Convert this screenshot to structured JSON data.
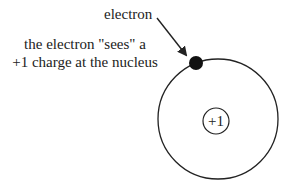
{
  "diagram": {
    "labels": {
      "electron": "electron",
      "sees_line1": "the electron \"sees\" a",
      "sees_line2": "+1 charge at the nucleus"
    },
    "nucleus": {
      "charge": "+1"
    },
    "colors": {
      "stroke": "#222222",
      "electron": "#111111",
      "background": "#ffffff"
    }
  }
}
